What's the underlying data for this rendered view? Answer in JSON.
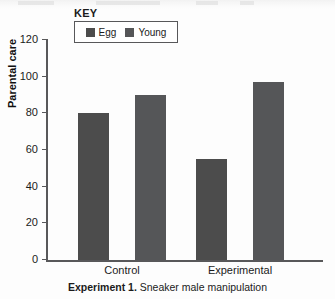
{
  "figure": {
    "key_title": "KEY",
    "caption_bold": "Experiment 1.",
    "caption_rest": " Sneaker male manipulation"
  },
  "colors": {
    "egg": "#4c4c4c",
    "young": "#555658",
    "axis": "#58585a",
    "text": "#1b1b1b",
    "background": "#fdfdfd"
  },
  "chart_data": {
    "type": "bar",
    "title": "Experiment 1. Sneaker male manipulation",
    "xlabel": "",
    "ylabel": "Parental care",
    "categories": [
      "Control",
      "Experimental"
    ],
    "series": [
      {
        "name": "Egg",
        "values": [
          80,
          55
        ],
        "color": "#4c4c4c"
      },
      {
        "name": "Young",
        "values": [
          90,
          97
        ],
        "color": "#555658"
      }
    ],
    "ylim": [
      0,
      120
    ],
    "yticks": [
      0,
      20,
      40,
      60,
      80,
      100,
      120
    ],
    "ytick_labels": [
      "0",
      "20",
      "40",
      "60",
      "80",
      "100",
      "120"
    ],
    "grid": false,
    "legend_position": "top-left-outside",
    "legend_title": "KEY"
  }
}
